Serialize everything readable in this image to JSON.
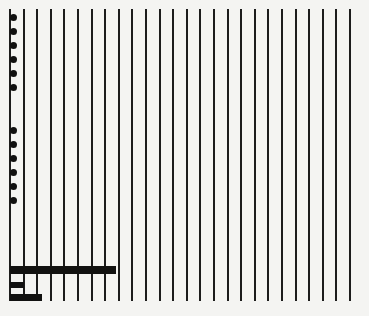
{
  "sheet": {
    "background": "#f4f4f2",
    "ink": "#111111",
    "lines": {
      "count": 26,
      "x_start": 9,
      "spacing": 13.6,
      "y_top": 9,
      "y_bottom": 301,
      "width": 2
    },
    "dots": {
      "x": 13,
      "group_top_y": [
        17,
        31,
        45,
        59,
        73,
        87
      ],
      "group_bottom_y": [
        130,
        144,
        158,
        172,
        186,
        200
      ]
    },
    "bars": [
      {
        "x": 10,
        "y": 266,
        "width": 106,
        "height": 8
      },
      {
        "x": 10,
        "y": 282,
        "width": 14,
        "height": 6
      },
      {
        "x": 10,
        "y": 294,
        "width": 32,
        "height": 7
      }
    ]
  }
}
